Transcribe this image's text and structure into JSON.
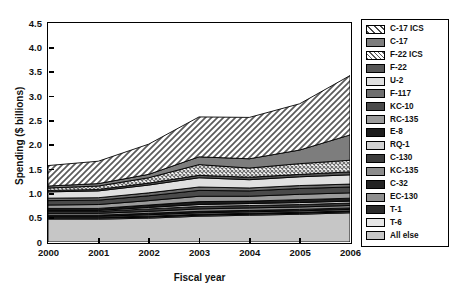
{
  "chart_data": {
    "type": "area",
    "stacked": true,
    "title": "",
    "xlabel": "Fiscal year",
    "ylabel": "Spending ($ billions)",
    "categories": [
      "2000",
      "2001",
      "2002",
      "2003",
      "2004",
      "2005",
      "2006"
    ],
    "x": [
      2000,
      2001,
      2002,
      2003,
      2004,
      2005,
      2006
    ],
    "xlim": [
      2000,
      2006
    ],
    "ylim": [
      0,
      4.5
    ],
    "yticks": [
      "0",
      "0.5",
      "1.0",
      "1.5",
      "2.0",
      "2.5",
      "3.0",
      "3.5",
      "4.0",
      "4.5"
    ],
    "ytick_values": [
      0,
      0.5,
      1.0,
      1.5,
      2.0,
      2.5,
      3.0,
      3.5,
      4.0,
      4.5
    ],
    "grid": false,
    "legend_position": "right-outside",
    "stack_order_bottom_to_top": [
      "All else",
      "T-6",
      "T-1",
      "EC-130",
      "C-32",
      "KC-135",
      "C-130",
      "RQ-1",
      "E-8",
      "RC-135",
      "KC-10",
      "F-117",
      "U-2",
      "F-22",
      "F-22 ICS",
      "C-17",
      "C-17 ICS"
    ],
    "series": [
      {
        "name": "C-17 ICS",
        "fill": "diagonal-hatch",
        "color": "#b4b4b4",
        "values": [
          0.42,
          0.46,
          0.62,
          0.82,
          0.85,
          0.95,
          1.22
        ]
      },
      {
        "name": "C-17",
        "fill": "solid",
        "color": "#7d7d7d",
        "values": [
          0.04,
          0.05,
          0.07,
          0.16,
          0.19,
          0.28,
          0.52
        ]
      },
      {
        "name": "F-22 ICS",
        "fill": "fine-crosshatch",
        "color": "#c8c8c8",
        "values": [
          0.05,
          0.07,
          0.11,
          0.22,
          0.19,
          0.22,
          0.24
        ]
      },
      {
        "name": "F-22",
        "fill": "solid",
        "color": "#565656",
        "values": [
          0.03,
          0.03,
          0.04,
          0.05,
          0.05,
          0.05,
          0.06
        ]
      },
      {
        "name": "U-2",
        "fill": "solid",
        "color": "#e0e0e0",
        "values": [
          0.13,
          0.14,
          0.16,
          0.19,
          0.17,
          0.18,
          0.19
        ]
      },
      {
        "name": "F-117",
        "fill": "solid",
        "color": "#6e6e6e",
        "values": [
          0.05,
          0.05,
          0.06,
          0.07,
          0.06,
          0.06,
          0.06
        ]
      },
      {
        "name": "KC-10",
        "fill": "solid",
        "color": "#4a4a4a",
        "values": [
          0.09,
          0.09,
          0.1,
          0.12,
          0.11,
          0.12,
          0.12
        ]
      },
      {
        "name": "RC-135",
        "fill": "solid",
        "color": "#9b9b9b",
        "values": [
          0.07,
          0.08,
          0.09,
          0.11,
          0.1,
          0.11,
          0.11
        ]
      },
      {
        "name": "E-8",
        "fill": "solid",
        "color": "#1c1c1c",
        "values": [
          0.04,
          0.04,
          0.05,
          0.06,
          0.05,
          0.06,
          0.06
        ]
      },
      {
        "name": "RQ-1",
        "fill": "solid",
        "color": "#d2d2d2",
        "values": [
          0.02,
          0.02,
          0.03,
          0.04,
          0.04,
          0.04,
          0.04
        ]
      },
      {
        "name": "C-130",
        "fill": "solid",
        "color": "#3c3c3c",
        "values": [
          0.04,
          0.04,
          0.05,
          0.05,
          0.05,
          0.05,
          0.05
        ]
      },
      {
        "name": "KC-135",
        "fill": "solid",
        "color": "#8c8c8c",
        "values": [
          0.04,
          0.04,
          0.04,
          0.05,
          0.05,
          0.05,
          0.05
        ]
      },
      {
        "name": "C-32",
        "fill": "solid",
        "color": "#232323",
        "values": [
          0.02,
          0.02,
          0.03,
          0.03,
          0.03,
          0.03,
          0.03
        ]
      },
      {
        "name": "EC-130",
        "fill": "solid",
        "color": "#8f8f8f",
        "values": [
          0.02,
          0.02,
          0.03,
          0.03,
          0.03,
          0.03,
          0.03
        ]
      },
      {
        "name": "T-1",
        "fill": "solid",
        "color": "#2b2b2b",
        "values": [
          0.02,
          0.02,
          0.02,
          0.02,
          0.02,
          0.02,
          0.02
        ]
      },
      {
        "name": "T-6",
        "fill": "solid",
        "color": "#e6e6e6",
        "values": [
          0.02,
          0.02,
          0.02,
          0.02,
          0.02,
          0.02,
          0.02
        ]
      },
      {
        "name": "All else",
        "fill": "solid",
        "color": "#c6c6c6",
        "values": [
          0.47,
          0.47,
          0.49,
          0.53,
          0.55,
          0.57,
          0.6
        ]
      }
    ],
    "totals": [
      1.57,
      1.66,
      2.01,
      2.57,
      2.56,
      2.84,
      3.42
    ]
  },
  "axes": {
    "y_title": "Spending ($ billions)",
    "x_title": "Fiscal year"
  },
  "legend": {
    "items": [
      {
        "label": "C-17 ICS",
        "swatch": "diagonal-hatch"
      },
      {
        "label": "C-17",
        "swatch": "solid"
      },
      {
        "label": "F-22 ICS",
        "swatch": "fine-crosshatch"
      },
      {
        "label": "F-22",
        "swatch": "solid"
      },
      {
        "label": "U-2",
        "swatch": "solid"
      },
      {
        "label": "F-117",
        "swatch": "solid"
      },
      {
        "label": "KC-10",
        "swatch": "solid"
      },
      {
        "label": "RC-135",
        "swatch": "solid"
      },
      {
        "label": "E-8",
        "swatch": "solid"
      },
      {
        "label": "RQ-1",
        "swatch": "solid"
      },
      {
        "label": "C-130",
        "swatch": "solid"
      },
      {
        "label": "KC-135",
        "swatch": "solid"
      },
      {
        "label": "C-32",
        "swatch": "solid"
      },
      {
        "label": "EC-130",
        "swatch": "solid"
      },
      {
        "label": "T-1",
        "swatch": "solid"
      },
      {
        "label": "T-6",
        "swatch": "solid"
      },
      {
        "label": "All else",
        "swatch": "solid"
      }
    ]
  }
}
